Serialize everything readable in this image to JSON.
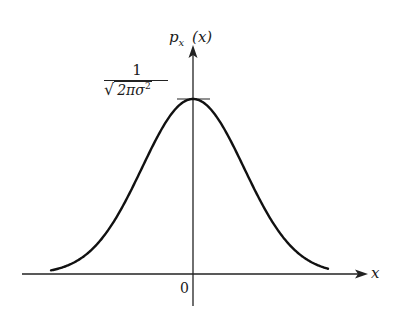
{
  "figure": {
    "y_axis_label": {
      "main": "p",
      "subscript": "x",
      "arg": "(x)"
    },
    "x_axis_label": "x",
    "origin_label": "0",
    "peak_label": {
      "numerator": "1",
      "denominator": "2πσ",
      "denominator_sup": "2",
      "radical": "√"
    }
  },
  "chart_data": {
    "type": "line",
    "title": "",
    "xlabel": "x",
    "ylabel": "p_x(x)",
    "function": "p_x(x) = 1/sqrt(2πσ²) · exp(-x²/(2σ²))",
    "center": 0,
    "peak_value_label": "1/√(2πσ²)",
    "x_ticks": [
      "0"
    ],
    "grid": false,
    "legend": false
  }
}
